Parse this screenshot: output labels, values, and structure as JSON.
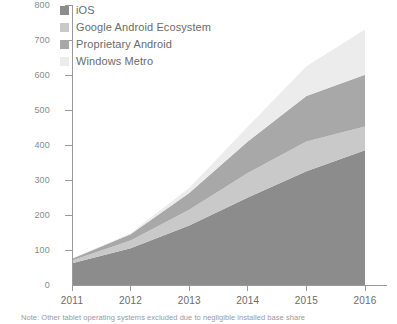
{
  "chart_data": {
    "type": "area",
    "title": "",
    "subtitle": "",
    "xlabel": "",
    "ylabel": "",
    "stacked": true,
    "grid": false,
    "legend_position": "top-left",
    "x": [
      2011,
      2012,
      2013,
      2014,
      2015,
      2016
    ],
    "categories": [
      "2011",
      "2012",
      "2013",
      "2014",
      "2015",
      "2016"
    ],
    "xlim": [
      2011,
      2016
    ],
    "ylim": [
      0,
      800
    ],
    "yticks": [
      0,
      100,
      200,
      300,
      400,
      500,
      600,
      700,
      800
    ],
    "ytick_labels": [
      "0",
      "100",
      "200",
      "300",
      "400",
      "500",
      "600",
      "700",
      "800"
    ],
    "xtick_labels": [
      "2011",
      "2012",
      "2013",
      "2014",
      "2015",
      "2016"
    ],
    "series": [
      {
        "name": "iOS",
        "color": "#8c8c8c",
        "values": [
          62,
          105,
          170,
          250,
          325,
          385
        ]
      },
      {
        "name": "Google Android Ecosystem",
        "color": "#c9c9c9",
        "values": [
          8,
          22,
          45,
          70,
          85,
          68
        ]
      },
      {
        "name": "Proprietary Android",
        "color": "#a8a8a8",
        "values": [
          5,
          18,
          48,
          90,
          130,
          148
        ]
      },
      {
        "name": "Windows Metro",
        "color": "#ececec",
        "values": [
          0,
          3,
          14,
          42,
          85,
          129
        ]
      }
    ],
    "cumulative_totals": [
      75,
      148,
      277,
      452,
      625,
      730
    ],
    "annotations": [
      "Note: Other tablet operating systems excluded due to negligible installed base share"
    ]
  },
  "legend": {
    "items": [
      {
        "label": "iOS",
        "color": "#8c8c8c"
      },
      {
        "label": "Google Android Ecosystem",
        "color": "#c9c9c9"
      },
      {
        "label": "Proprietary Android",
        "color": "#a8a8a8"
      },
      {
        "label": "Windows Metro",
        "color": "#ececec"
      }
    ]
  },
  "footnote": {
    "text": "Note: Other tablet operating systems excluded due to negligible installed base share"
  },
  "axis": {
    "y_labels": [
      "800",
      "700",
      "600",
      "500",
      "400",
      "300",
      "200",
      "100",
      "0"
    ],
    "x_labels": [
      "2011",
      "2012",
      "2013",
      "2014",
      "2015",
      "2016"
    ]
  },
  "colors": {
    "axis_line": "#9a9a9a",
    "tick_text": "#8a8a8a",
    "legend_text": "#6b6b6b",
    "footnote_text": "#9a9a9a",
    "background": "#ffffff"
  }
}
